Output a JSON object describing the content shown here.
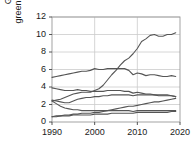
{
  "chart_data": {
    "type": "line",
    "title": "",
    "subtitle": "",
    "xlabel": "",
    "ylabel": "Global greenhouse gas\nemissions ( Gt CO2)",
    "ylabel_line1": "Global greenhouse gas",
    "ylabel_line2_pre": "emissions ( Gt CO",
    "ylabel_line2_sub": "2",
    "ylabel_line2_post": ")",
    "xlim": [
      1990,
      2020
    ],
    "ylim": [
      0,
      12
    ],
    "xticks": [
      1990,
      2000,
      2010,
      2020
    ],
    "xtick_labels": [
      "1990",
      "2000",
      "2010",
      "2020"
    ],
    "yticks": [
      0,
      2,
      4,
      6,
      8,
      10,
      12
    ],
    "ytick_labels": [
      "0",
      "2",
      "4",
      "6",
      "8",
      "10",
      "12"
    ],
    "grid": true,
    "legend": "none",
    "line_color": "#555555",
    "grid_color": "#cccccc",
    "axis_color": "#999999",
    "x": [
      1990,
      1991,
      1992,
      1993,
      1994,
      1995,
      1996,
      1997,
      1998,
      1999,
      2000,
      2001,
      2002,
      2003,
      2004,
      2005,
      2006,
      2007,
      2008,
      2009,
      2010,
      2011,
      2012,
      2013,
      2014,
      2015,
      2016,
      2017,
      2018,
      2019
    ],
    "series": [
      {
        "name": "series-rising",
        "values": [
          2.4,
          2.5,
          2.6,
          2.8,
          3.0,
          3.2,
          3.3,
          3.4,
          3.4,
          3.4,
          3.6,
          3.8,
          4.2,
          4.8,
          5.4,
          5.9,
          6.5,
          7.0,
          7.3,
          7.8,
          8.4,
          9.2,
          9.5,
          9.9,
          10.0,
          9.8,
          9.8,
          10.0,
          10.0,
          10.2
        ]
      },
      {
        "name": "series-plateau-high",
        "values": [
          5.1,
          5.2,
          5.3,
          5.4,
          5.5,
          5.6,
          5.7,
          5.8,
          5.8,
          5.9,
          6.1,
          6.0,
          6.0,
          6.1,
          6.1,
          6.1,
          6.1,
          6.1,
          5.9,
          5.4,
          5.6,
          5.5,
          5.3,
          5.4,
          5.4,
          5.3,
          5.2,
          5.2,
          5.3,
          5.2
        ]
      },
      {
        "name": "series-mid-declining",
        "values": [
          3.9,
          3.8,
          3.7,
          3.6,
          3.6,
          3.6,
          3.7,
          3.6,
          3.6,
          3.5,
          3.5,
          3.5,
          3.5,
          3.6,
          3.6,
          3.6,
          3.6,
          3.5,
          3.5,
          3.3,
          3.4,
          3.3,
          3.2,
          3.2,
          3.1,
          3.1,
          3.1,
          3.1,
          3.0,
          2.9
        ]
      },
      {
        "name": "series-rising-low",
        "values": [
          2.5,
          2.4,
          2.3,
          2.2,
          2.2,
          2.4,
          2.6,
          2.7,
          2.8,
          2.8,
          2.9,
          2.9,
          3.0,
          3.0,
          3.1,
          3.1,
          3.1,
          3.1,
          3.1,
          3.0,
          3.1,
          3.1,
          3.1,
          3.1,
          3.1,
          3.0,
          3.0,
          3.0,
          3.0,
          2.9
        ]
      },
      {
        "name": "series-low-growth",
        "values": [
          0.6,
          0.7,
          0.7,
          0.8,
          0.8,
          0.9,
          0.9,
          1.0,
          1.0,
          1.0,
          1.1,
          1.1,
          1.2,
          1.3,
          1.4,
          1.5,
          1.6,
          1.7,
          1.8,
          1.8,
          1.9,
          2.0,
          2.1,
          2.2,
          2.3,
          2.3,
          2.4,
          2.5,
          2.6,
          2.7
        ]
      },
      {
        "name": "series-flat-low",
        "values": [
          2.4,
          2.1,
          1.8,
          1.6,
          1.5,
          1.4,
          1.4,
          1.3,
          1.3,
          1.3,
          1.3,
          1.3,
          1.3,
          1.3,
          1.3,
          1.3,
          1.3,
          1.3,
          1.3,
          1.2,
          1.3,
          1.3,
          1.3,
          1.3,
          1.3,
          1.3,
          1.3,
          1.3,
          1.3,
          1.3
        ]
      },
      {
        "name": "series-lowest",
        "values": [
          0.6,
          0.6,
          0.7,
          0.7,
          0.7,
          0.8,
          0.8,
          0.8,
          0.8,
          0.8,
          0.9,
          0.9,
          0.9,
          0.9,
          1.0,
          1.0,
          1.0,
          1.0,
          1.0,
          1.0,
          1.1,
          1.1,
          1.1,
          1.1,
          1.1,
          1.1,
          1.1,
          1.1,
          1.2,
          1.2
        ]
      }
    ]
  }
}
